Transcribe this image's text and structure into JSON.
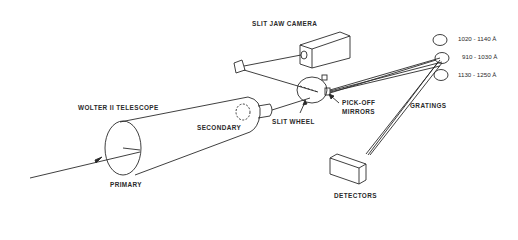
{
  "diagram": {
    "type": "optical-schematic",
    "labels": {
      "slit_jaw_camera": "SLIT JAW CAMERA",
      "wolter_telescope": "WOLTER II TELESCOPE",
      "secondary": "SECONDARY",
      "primary": "PRIMARY",
      "slit_wheel": "SLIT WHEEL",
      "pick_off_mirrors_line1": "PICK-OFF",
      "pick_off_mirrors_line2": "MIRRORS",
      "gratings": "GRATINGS",
      "detectors": "DETECTORS"
    },
    "wavelength_bands": [
      {
        "label": "1020 - 1140 Å"
      },
      {
        "label": "910 - 1030 Å"
      },
      {
        "label": "1130 - 1250 Å"
      }
    ],
    "stroke_color": "#2a2a2a",
    "background_color": "#ffffff"
  }
}
